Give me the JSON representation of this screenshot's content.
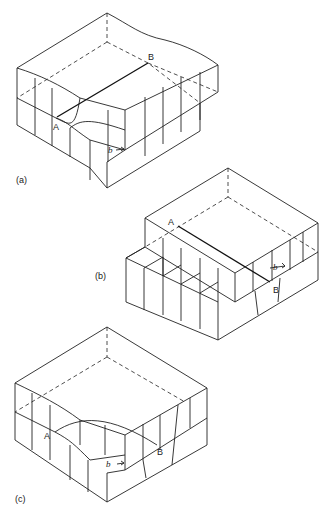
{
  "figure": {
    "panels": [
      {
        "id": "a",
        "caption": "(a)",
        "point_a": "A",
        "point_b": "B",
        "burgers_vector": "b",
        "description": "edge dislocation AB through block, slip step on front face"
      },
      {
        "id": "b",
        "caption": "(b)",
        "point_a": "A",
        "point_b": "B",
        "burgers_vector": "b",
        "description": "screw dislocation AB, step on side face"
      },
      {
        "id": "c",
        "caption": "(c)",
        "point_a": "A",
        "point_b": "B",
        "burgers_vector": "b",
        "description": "mixed (curved) dislocation AB"
      }
    ]
  }
}
